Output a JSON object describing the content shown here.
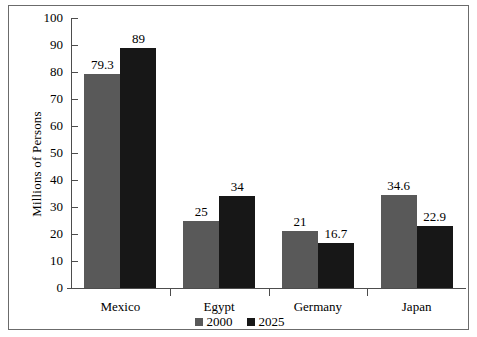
{
  "chart_data": {
    "type": "bar",
    "title": "",
    "xlabel": "",
    "ylabel": "Millions of Persons",
    "ylim": [
      0,
      100
    ],
    "ytick_step": 10,
    "yticks": [
      100,
      90,
      80,
      70,
      60,
      50,
      40,
      30,
      20,
      10,
      0
    ],
    "ytick_labels": [
      "100",
      "90",
      "80",
      "70",
      "60",
      "50",
      "40",
      "30",
      "20",
      "10",
      "0"
    ],
    "grid": false,
    "legend_position": "bottom-center",
    "categories": [
      "Mexico",
      "Egypt",
      "Germany",
      "Japan"
    ],
    "series": [
      {
        "name": "2000",
        "color": "#595959",
        "values": [
          79.3,
          25,
          21,
          34.6
        ],
        "labels": [
          "79.3",
          "25",
          "21",
          "34.6"
        ]
      },
      {
        "name": "2025",
        "color": "#171717",
        "values": [
          89,
          34,
          16.7,
          22.9
        ],
        "labels": [
          "89",
          "34",
          "16.7",
          "22.9"
        ]
      }
    ]
  },
  "legend": {
    "items": [
      {
        "label": "2000",
        "color": "#595959"
      },
      {
        "label": "2025",
        "color": "#171717"
      }
    ]
  },
  "colors": {
    "series_2000": "#595959",
    "series_2025": "#171717",
    "axis": "#4d4d4d",
    "frame": "#6b6b6b",
    "background": "#ffffff"
  }
}
